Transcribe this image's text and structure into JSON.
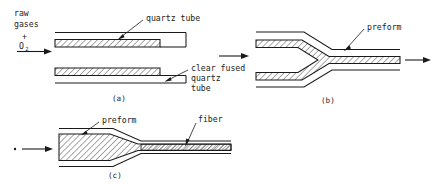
{
  "figure": {
    "background_color": "#ffffff",
    "ink_color": "#1a1a1a"
  },
  "panels": [
    {
      "id": "a",
      "caption": "(a)",
      "inlet": {
        "line1": "raw",
        "line2": "gases",
        "plus": "+",
        "gas_symbol": "O",
        "gas_subscript": "2",
        "arrow_icon": "arrow-right-icon"
      },
      "labels": [
        {
          "name": "quartz-tube",
          "text": "quartz tube",
          "leader_icon": "leader-arrow-icon"
        },
        {
          "name": "clear-fused-quartz-tube",
          "line1": "clear fused",
          "line2": "quartz",
          "line3": "tube",
          "leader_icon": "leader-arrow-icon"
        }
      ]
    },
    {
      "id": "b",
      "caption": "(b)",
      "inlet": {
        "arrow_icon": "arrow-right-icon"
      },
      "outlet": {
        "arrow_icon": "arrow-right-icon"
      },
      "labels": [
        {
          "name": "preform",
          "text": "preform",
          "leader_icon": "leader-arrow-icon"
        }
      ]
    },
    {
      "id": "c",
      "caption": "(c)",
      "inlet": {
        "dot_icon": "dot-icon",
        "arrow_icon": "arrow-right-icon"
      },
      "labels": [
        {
          "name": "preform",
          "text": "preform",
          "leader_icon": "leader-arrow-icon"
        },
        {
          "name": "fiber",
          "text": "fiber",
          "leader_icon": "leader-arrow-icon"
        }
      ]
    }
  ]
}
